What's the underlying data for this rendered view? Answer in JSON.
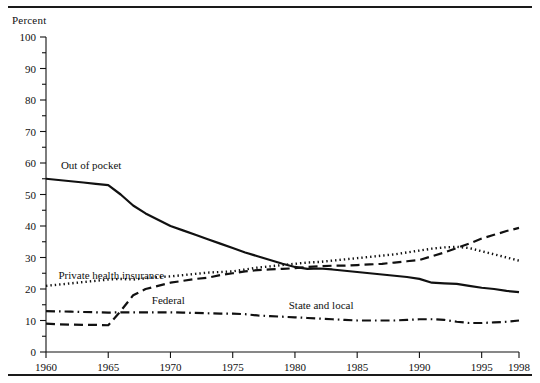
{
  "figure": {
    "axis_title": "Percent",
    "top_rule": true,
    "bottom_rule": true
  },
  "chart_data": {
    "type": "line",
    "title": "",
    "subtitle": "",
    "xlabel": "",
    "ylabel": "Percent",
    "xlim": [
      1960,
      1998
    ],
    "ylim": [
      0,
      100
    ],
    "grid": false,
    "legend_position": "inline-annotations",
    "y_ticks": [
      0,
      10,
      20,
      30,
      40,
      50,
      60,
      70,
      80,
      90,
      100
    ],
    "y_minor_ticks": [
      5,
      15,
      25,
      35,
      45,
      55,
      65,
      75,
      85,
      95
    ],
    "x_ticks": [
      1960,
      1965,
      1970,
      1975,
      1980,
      1985,
      1990,
      1995,
      1998
    ],
    "x_tick_labels": [
      "1960",
      "1965",
      "1970",
      "1975",
      "1980",
      "1985",
      "1990",
      "1995",
      "1998"
    ],
    "x": [
      1960,
      1961,
      1962,
      1963,
      1964,
      1965,
      1966,
      1967,
      1968,
      1969,
      1970,
      1971,
      1972,
      1973,
      1974,
      1975,
      1976,
      1977,
      1978,
      1979,
      1980,
      1981,
      1982,
      1983,
      1984,
      1985,
      1986,
      1987,
      1988,
      1989,
      1990,
      1991,
      1992,
      1993,
      1994,
      1995,
      1996,
      1997,
      1998
    ],
    "series": [
      {
        "name": "Out of pocket",
        "line_style": "solid",
        "color": "#111111",
        "label_x": 1961.2,
        "label_y": 59.5,
        "values": [
          55.0,
          54.6,
          54.2,
          53.8,
          53.4,
          53.0,
          50.0,
          46.5,
          44.0,
          42.0,
          40.0,
          38.6,
          37.2,
          35.8,
          34.4,
          33.0,
          31.6,
          30.4,
          29.2,
          28.0,
          27.0,
          26.4,
          26.5,
          26.2,
          25.8,
          25.4,
          25.0,
          24.6,
          24.2,
          23.8,
          23.2,
          22.0,
          21.8,
          21.6,
          21.0,
          20.4,
          20.0,
          19.4,
          19.0
        ]
      },
      {
        "name": "Private health insurance",
        "line_style": "dotted",
        "color": "#111111",
        "label_x": 1961.0,
        "label_y": 24.5,
        "values": [
          21.0,
          21.4,
          21.8,
          22.2,
          22.6,
          23.0,
          23.2,
          23.0,
          23.4,
          23.8,
          24.0,
          24.4,
          24.8,
          25.2,
          25.4,
          25.6,
          26.2,
          26.8,
          27.2,
          27.6,
          28.0,
          28.4,
          28.6,
          29.0,
          29.4,
          29.8,
          30.2,
          30.6,
          31.0,
          31.6,
          32.2,
          32.8,
          33.2,
          33.4,
          33.0,
          32.0,
          31.0,
          30.0,
          29.0
        ]
      },
      {
        "name": "Federal",
        "line_style": "dashed",
        "color": "#111111",
        "label_x": 1968.5,
        "label_y": 16.5,
        "values": [
          9.0,
          8.8,
          8.7,
          8.6,
          8.6,
          8.5,
          13.0,
          18.0,
          20.0,
          21.0,
          22.0,
          22.6,
          23.2,
          23.6,
          24.4,
          25.0,
          25.6,
          26.0,
          26.2,
          26.4,
          26.6,
          27.0,
          27.2,
          27.4,
          27.4,
          27.6,
          27.8,
          28.0,
          28.4,
          28.8,
          29.2,
          30.4,
          31.6,
          33.0,
          34.4,
          36.0,
          37.2,
          38.4,
          39.4
        ]
      },
      {
        "name": "State and local",
        "line_style": "dashdot",
        "color": "#111111",
        "label_x": 1979.5,
        "label_y": 15.0,
        "values": [
          13.0,
          12.9,
          12.8,
          12.7,
          12.6,
          12.5,
          12.6,
          12.6,
          12.6,
          12.6,
          12.6,
          12.5,
          12.4,
          12.3,
          12.2,
          12.2,
          12.0,
          11.6,
          11.4,
          11.2,
          11.0,
          10.8,
          10.6,
          10.4,
          10.2,
          10.0,
          10.0,
          10.0,
          10.0,
          10.2,
          10.4,
          10.4,
          10.2,
          9.6,
          9.2,
          9.2,
          9.4,
          9.6,
          10.0
        ]
      }
    ]
  }
}
